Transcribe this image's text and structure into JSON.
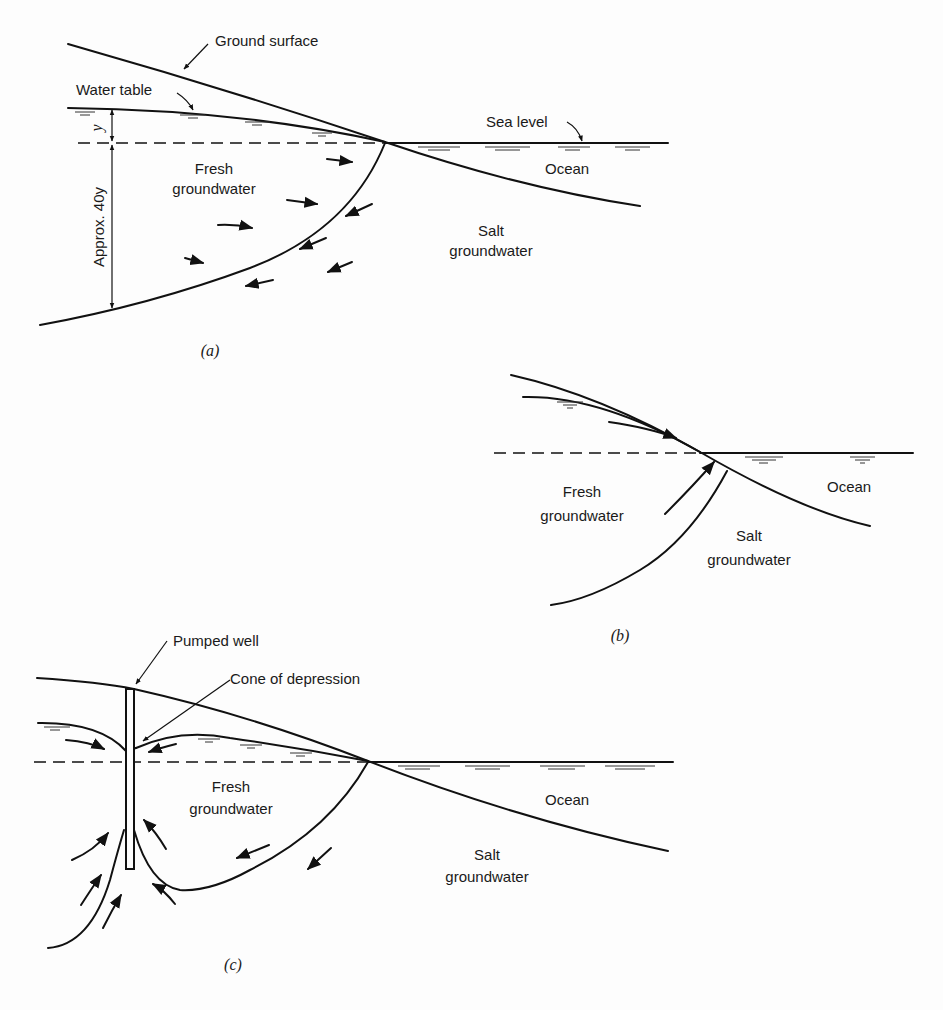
{
  "figure": {
    "panels": [
      {
        "id": "a",
        "caption": "(a)",
        "labels": {
          "ground_surface": "Ground surface",
          "water_table": "Water table",
          "sea_level": "Sea level",
          "ocean": "Ocean",
          "fresh_line1": "Fresh",
          "fresh_line2": "groundwater",
          "salt_line1": "Salt",
          "salt_line2": "groundwater",
          "dim_y": "y",
          "dim_40y": "Approx. 40y"
        }
      },
      {
        "id": "b",
        "caption": "(b)",
        "labels": {
          "ocean": "Ocean",
          "fresh_line1": "Fresh",
          "fresh_line2": "groundwater",
          "salt_line1": "Salt",
          "salt_line2": "groundwater"
        }
      },
      {
        "id": "c",
        "caption": "(c)",
        "labels": {
          "pumped_well": "Pumped well",
          "cone_of_depression": "Cone of depression",
          "ocean": "Ocean",
          "fresh_line1": "Fresh",
          "fresh_line2": "groundwater",
          "salt_line1": "Salt",
          "salt_line2": "groundwater"
        }
      }
    ]
  }
}
